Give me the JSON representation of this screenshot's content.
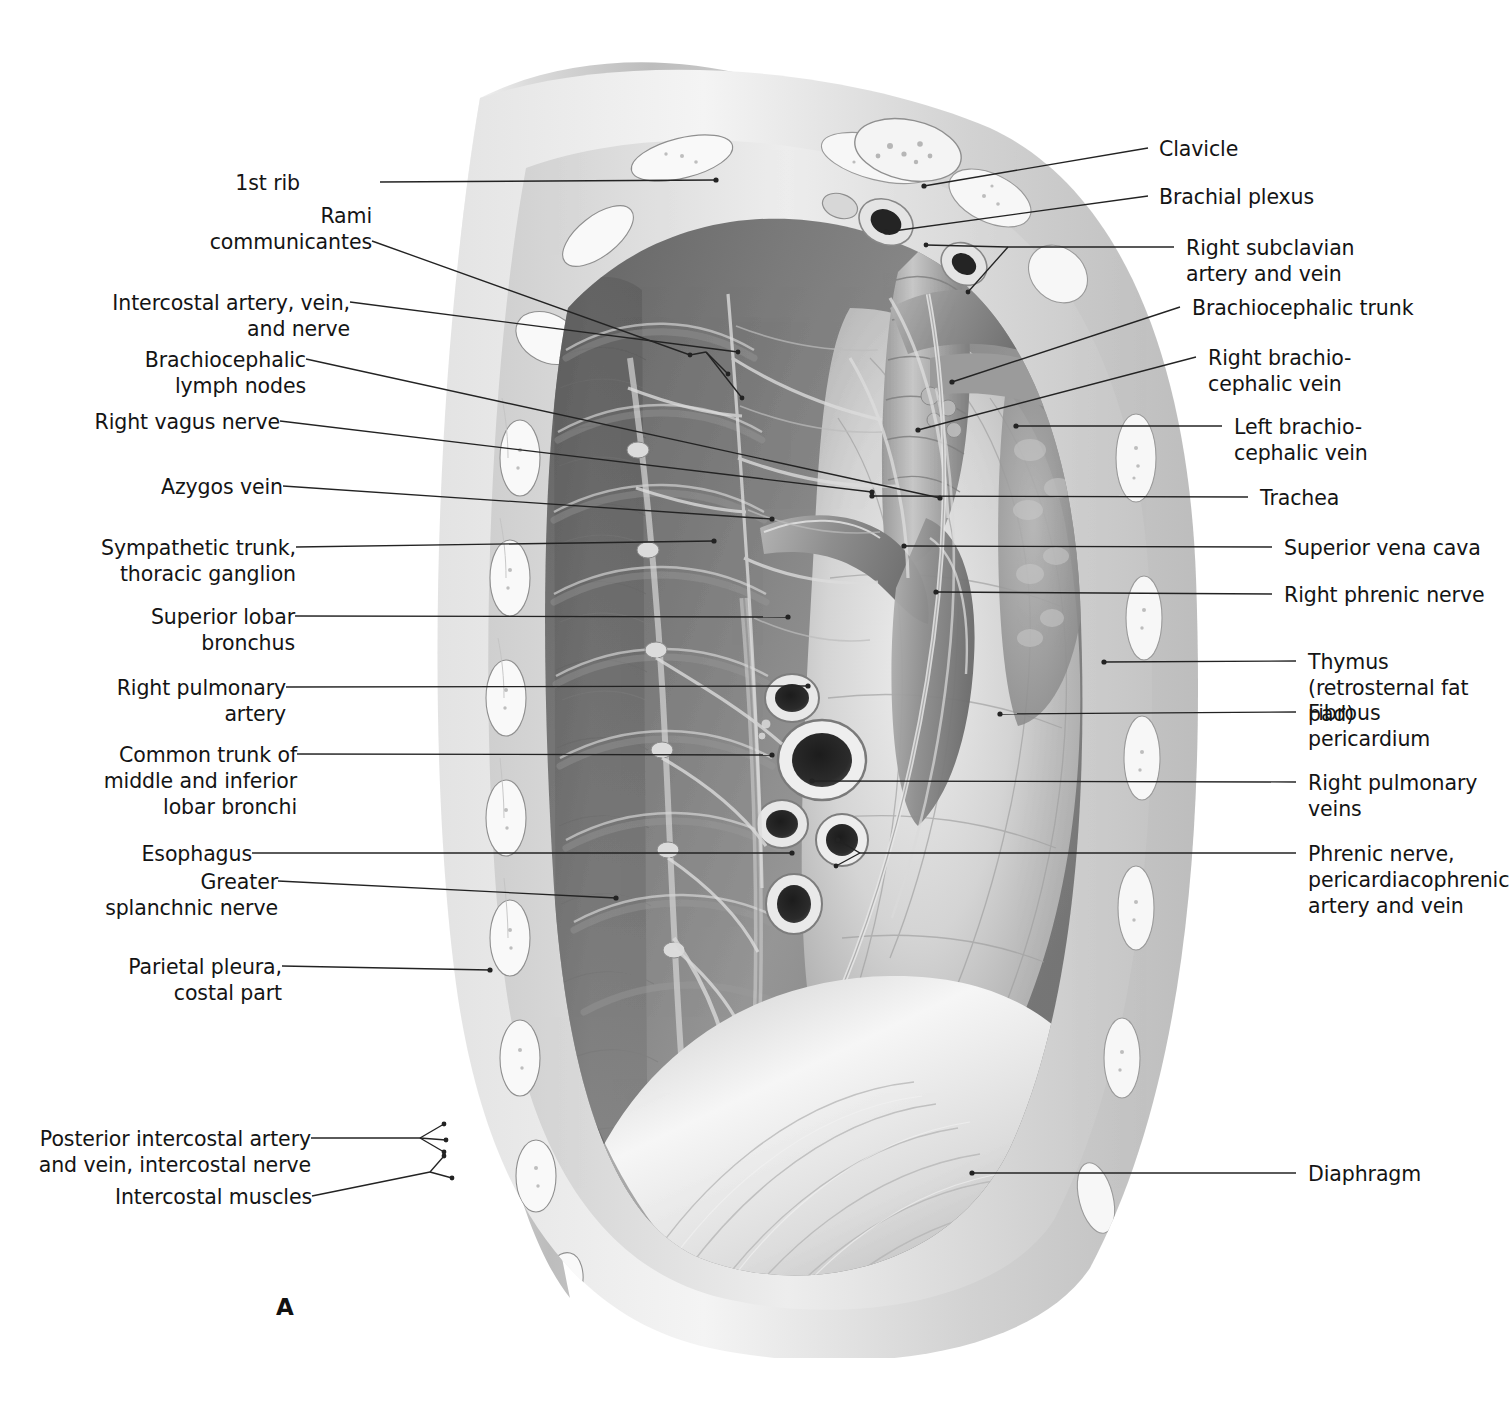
{
  "figure": {
    "panel_letter": "A",
    "view": "right-half thorax, parasagittal section",
    "style": "grayscale airbrush anatomical illustration",
    "background_color": "#ffffff",
    "ink_color": "#232323"
  },
  "labels_left": [
    {
      "id": "first-rib",
      "text": "1st rib"
    },
    {
      "id": "rami-communicantes",
      "text": "Rami\ncommunicantes"
    },
    {
      "id": "intercostal-avn",
      "text": "Intercostal artery, vein,\nand nerve"
    },
    {
      "id": "brachiocephalic-nodes",
      "text": "Brachiocephalic\nlymph nodes"
    },
    {
      "id": "right-vagus-nerve",
      "text": "Right vagus nerve"
    },
    {
      "id": "azygos-vein",
      "text": "Azygos vein"
    },
    {
      "id": "sympathetic-trunk",
      "text": "Sympathetic trunk,\nthoracic ganglion"
    },
    {
      "id": "superior-lobar-bronchus",
      "text": "Superior lobar\nbronchus"
    },
    {
      "id": "right-pulmonary-artery",
      "text": "Right pulmonary\nartery"
    },
    {
      "id": "common-trunk-bronchi",
      "text": "Common trunk of\nmiddle and inferior\nlobar bronchi"
    },
    {
      "id": "esophagus",
      "text": "Esophagus"
    },
    {
      "id": "greater-splanchnic",
      "text": "Greater\nsplanchnic nerve"
    },
    {
      "id": "parietal-pleura",
      "text": "Parietal pleura,\ncostal part"
    },
    {
      "id": "posterior-intercostal",
      "text": "Posterior intercostal artery\nand vein, intercostal nerve"
    },
    {
      "id": "intercostal-muscles",
      "text": "Intercostal muscles"
    }
  ],
  "labels_right": [
    {
      "id": "clavicle",
      "text": "Clavicle"
    },
    {
      "id": "brachial-plexus",
      "text": "Brachial plexus"
    },
    {
      "id": "right-subclavian",
      "text": "Right subclavian\nartery and vein"
    },
    {
      "id": "brachiocephalic-trunk",
      "text": "Brachiocephalic trunk"
    },
    {
      "id": "right-brachiocephalic-vein",
      "text": "Right brachio-\ncephalic vein"
    },
    {
      "id": "left-brachiocephalic-vein",
      "text": "Left brachio-\ncephalic vein"
    },
    {
      "id": "trachea",
      "text": "Trachea"
    },
    {
      "id": "superior-vena-cava",
      "text": "Superior vena cava"
    },
    {
      "id": "right-phrenic-nerve",
      "text": "Right phrenic nerve"
    },
    {
      "id": "thymus",
      "text": "Thymus\n(retrosternal fat pad)"
    },
    {
      "id": "fibrous-pericardium",
      "text": "Fibrous\npericardium"
    },
    {
      "id": "right-pulmonary-veins",
      "text": "Right pulmonary\nveins"
    },
    {
      "id": "phrenic-pericardiacophrenic",
      "text": "Phrenic nerve,\npericardiacophrenic\nartery and vein"
    },
    {
      "id": "diaphragm",
      "text": "Diaphragm"
    }
  ]
}
